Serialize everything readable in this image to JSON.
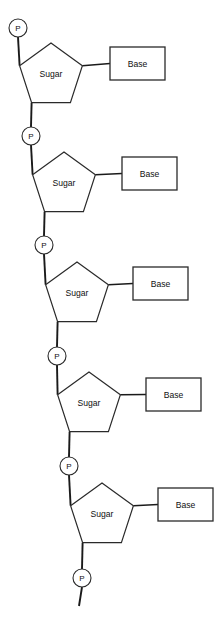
{
  "diagram": {
    "type": "nucleotide-chain",
    "background_color": "#ffffff",
    "stroke_color": "#2a2a2a",
    "text_color": "#111111",
    "labels": {
      "phosphate": "P",
      "sugar": "Sugar",
      "base": "Base"
    },
    "phosphates": [
      {
        "id": "phosphate-1",
        "label": "P",
        "cx": 18,
        "cy": 28,
        "r": 9
      },
      {
        "id": "phosphate-2",
        "label": "P",
        "cx": 31,
        "cy": 136,
        "r": 9
      },
      {
        "id": "phosphate-3",
        "label": "P",
        "cx": 44,
        "cy": 245,
        "r": 9
      },
      {
        "id": "phosphate-4",
        "label": "P",
        "cx": 57,
        "cy": 356,
        "r": 9
      },
      {
        "id": "phosphate-5",
        "label": "P",
        "cx": 69,
        "cy": 466,
        "r": 9
      },
      {
        "id": "phosphate-6",
        "label": "P",
        "cx": 82,
        "cy": 578,
        "r": 9
      }
    ],
    "sugars": [
      {
        "id": "sugar-1",
        "label": "Sugar",
        "cx": 51,
        "cy": 76,
        "text_x": 51,
        "text_y": 74
      },
      {
        "id": "sugar-2",
        "label": "Sugar",
        "cx": 64,
        "cy": 185,
        "text_x": 64,
        "text_y": 183
      },
      {
        "id": "sugar-3",
        "label": "Sugar",
        "cx": 77,
        "cy": 295,
        "text_x": 77,
        "text_y": 293
      },
      {
        "id": "sugar-4",
        "label": "Sugar",
        "cx": 89,
        "cy": 405,
        "text_x": 89,
        "text_y": 403
      },
      {
        "id": "sugar-5",
        "label": "Sugar",
        "cx": 102,
        "cy": 516,
        "text_x": 102,
        "text_y": 514
      }
    ],
    "bases": [
      {
        "id": "base-1",
        "label": "Base",
        "x": 110,
        "y": 47,
        "width": 55,
        "height": 33
      },
      {
        "id": "base-2",
        "label": "Base",
        "x": 122,
        "y": 157,
        "width": 55,
        "height": 33
      },
      {
        "id": "base-3",
        "label": "Base",
        "x": 133,
        "y": 267,
        "width": 55,
        "height": 33
      },
      {
        "id": "base-4",
        "label": "Base",
        "x": 146,
        "y": 378,
        "width": 55,
        "height": 33
      },
      {
        "id": "base-5",
        "label": "Base",
        "x": 158,
        "y": 488,
        "width": 55,
        "height": 33
      }
    ],
    "tail": {
      "id": "chain-tail",
      "x1": 82,
      "y1": 587,
      "x2": 79,
      "y2": 606
    }
  }
}
